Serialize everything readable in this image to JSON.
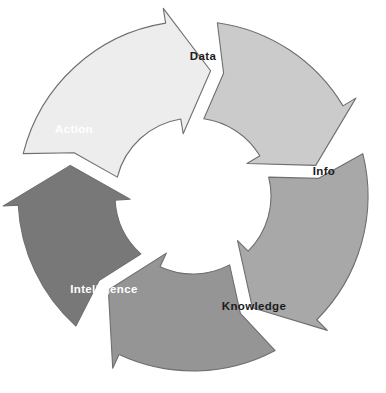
{
  "diagram": {
    "type": "circular-cycle",
    "direction": "clockwise",
    "background_color": "#ffffff",
    "outline_color": "#6f6f6f",
    "center": {
      "x": 193,
      "y": 196
    },
    "outer_radius": 175,
    "inner_radius": 78,
    "segments": [
      {
        "id": "data",
        "label": "Data",
        "order": 1,
        "fill": "#ededed",
        "text_color": "#1c1c1c",
        "label_x": 203,
        "label_y": 57,
        "start_angle": -76,
        "end_angle": 8
      },
      {
        "id": "info",
        "label": "Info",
        "order": 2,
        "fill": "#cbcbcb",
        "text_color": "#1c1c1c",
        "label_x": 324,
        "label_y": 172,
        "start_angle": 8,
        "end_angle": 76
      },
      {
        "id": "knowledge",
        "label": "Knowledge",
        "order": 3,
        "fill": "#a8a8a8",
        "text_color": "#1c1c1c",
        "label_x": 254,
        "label_y": 307,
        "start_angle": 76,
        "end_angle": 152
      },
      {
        "id": "intelligence",
        "label": "Intelligence",
        "order": 4,
        "fill": "#959595",
        "text_color": "#ffffff",
        "label_x": 104,
        "label_y": 290,
        "start_angle": 152,
        "end_angle": 222
      },
      {
        "id": "action",
        "label": "Action",
        "order": 5,
        "fill": "#787878",
        "text_color": "#ffffff",
        "label_x": 74,
        "label_y": 130,
        "start_angle": 222,
        "end_angle": 284
      }
    ]
  }
}
